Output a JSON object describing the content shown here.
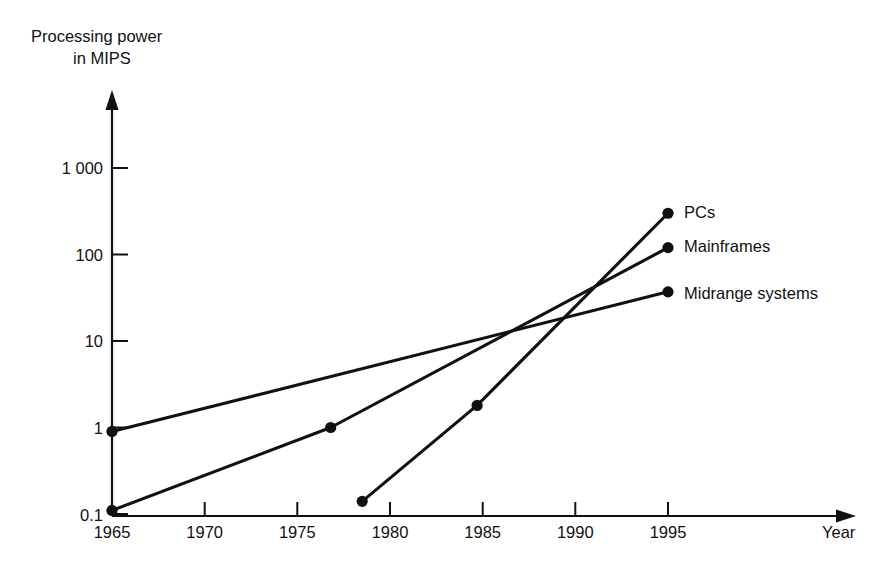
{
  "chart_data": {
    "type": "line",
    "title": "",
    "xlabel": "Year",
    "ylabel_line1": "Processing power",
    "ylabel_line2": "in MIPS",
    "yscale": "log",
    "xlim": [
      1965,
      1998
    ],
    "ylim": [
      0.1,
      1000
    ],
    "grid": false,
    "legend_position": "right-inline-labels",
    "x_ticks": [
      "1965",
      "1970",
      "1975",
      "1980",
      "1985",
      "1990",
      "1995"
    ],
    "x_tick_values": [
      1965,
      1970,
      1975,
      1980,
      1985,
      1990,
      1995
    ],
    "y_ticks": [
      "0.1",
      "1",
      "10",
      "100",
      "1 000"
    ],
    "y_tick_values": [
      0.1,
      1,
      10,
      100,
      1000
    ],
    "series": [
      {
        "name": "PCs",
        "x": [
          1978.5,
          1984.7,
          1995
        ],
        "y": [
          0.14,
          1.8,
          300
        ],
        "markers": [
          true,
          true,
          true
        ]
      },
      {
        "name": "Mainframes",
        "x": [
          1965,
          1976.8,
          1995
        ],
        "y": [
          0.11,
          1.0,
          120
        ],
        "markers": [
          true,
          true,
          true
        ]
      },
      {
        "name": "Midrange systems",
        "x": [
          1965,
          1995
        ],
        "y": [
          0.9,
          37
        ],
        "markers": [
          true,
          true
        ]
      }
    ]
  },
  "axes": {
    "y_axis_label": {
      "line1": "Processing power",
      "line2": "in MIPS"
    },
    "x_axis_label": "Year"
  },
  "y_tick_labels": [
    {
      "text": "1 000",
      "value": 1000
    },
    {
      "text": "100",
      "value": 100
    },
    {
      "text": "10",
      "value": 10
    },
    {
      "text": "1",
      "value": 1
    },
    {
      "text": "0.1",
      "value": 0.1
    }
  ],
  "x_tick_labels": [
    {
      "text": "1965",
      "value": 1965
    },
    {
      "text": "1970",
      "value": 1970
    },
    {
      "text": "1975",
      "value": 1975
    },
    {
      "text": "1980",
      "value": 1980
    },
    {
      "text": "1985",
      "value": 1985
    },
    {
      "text": "1990",
      "value": 1990
    },
    {
      "text": "1995",
      "value": 1995
    }
  ],
  "series_labels": [
    {
      "text": "PCs"
    },
    {
      "text": "Mainframes"
    },
    {
      "text": "Midrange systems"
    }
  ],
  "colors": {
    "ink": "#111111",
    "background": "#ffffff"
  }
}
